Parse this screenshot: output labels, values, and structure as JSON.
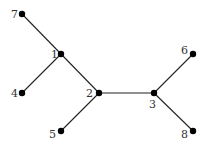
{
  "diagram": {
    "type": "tree-graph",
    "nodes": [
      {
        "id": "1",
        "label": "1",
        "x": 61,
        "y": 54,
        "lx": 51,
        "ly": 58
      },
      {
        "id": "2",
        "label": "2",
        "x": 99,
        "y": 93,
        "lx": 86,
        "ly": 97
      },
      {
        "id": "3",
        "label": "3",
        "x": 154,
        "y": 93,
        "lx": 149,
        "ly": 108
      },
      {
        "id": "4",
        "label": "4",
        "x": 22,
        "y": 93,
        "lx": 11,
        "ly": 97
      },
      {
        "id": "5",
        "label": "5",
        "x": 61,
        "y": 131,
        "lx": 49,
        "ly": 138
      },
      {
        "id": "6",
        "label": "6",
        "x": 193,
        "y": 54,
        "lx": 181,
        "ly": 54
      },
      {
        "id": "7",
        "label": "7",
        "x": 22,
        "y": 14,
        "lx": 11,
        "ly": 18
      },
      {
        "id": "8",
        "label": "8",
        "x": 193,
        "y": 131,
        "lx": 181,
        "ly": 138
      }
    ],
    "edges": [
      [
        "7",
        "1"
      ],
      [
        "1",
        "4"
      ],
      [
        "1",
        "2"
      ],
      [
        "2",
        "5"
      ],
      [
        "2",
        "3"
      ],
      [
        "3",
        "6"
      ],
      [
        "3",
        "8"
      ]
    ],
    "colors": {
      "edge": "#222222",
      "node": "#000000",
      "label": "#333333"
    }
  }
}
